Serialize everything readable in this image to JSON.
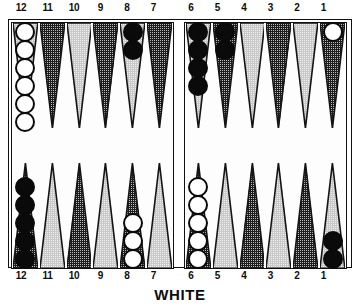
{
  "board": {
    "caption": "WHITE",
    "top_labels": [
      "12",
      "11",
      "10",
      "9",
      "8",
      "7",
      "6",
      "5",
      "4",
      "3",
      "2",
      "1"
    ],
    "bottom_labels": [
      "12",
      "11",
      "10",
      "9",
      "8",
      "7",
      "6",
      "5",
      "4",
      "3",
      "2",
      "1"
    ],
    "colors": {
      "white_checker": "#ffffff",
      "black_checker": "#0a0a0a",
      "outline": "#0a0a0a",
      "point_light": "#efefef",
      "point_dark": "#bdbdbd",
      "board_background": "#ffffff",
      "frame": "#101010"
    },
    "quadrants": {
      "top_left": {
        "name": "top-left-quadrant",
        "points": [
          {
            "label": "12",
            "shade": "light",
            "checkers": 6,
            "color": "white"
          },
          {
            "label": "11",
            "shade": "dark",
            "checkers": 0,
            "color": ""
          },
          {
            "label": "10",
            "shade": "light",
            "checkers": 0,
            "color": ""
          },
          {
            "label": "9",
            "shade": "dark",
            "checkers": 0,
            "color": ""
          },
          {
            "label": "8",
            "shade": "light",
            "checkers": 2,
            "color": "black"
          },
          {
            "label": "7",
            "shade": "dark",
            "checkers": 0,
            "color": ""
          }
        ]
      },
      "top_right": {
        "name": "top-right-quadrant",
        "points": [
          {
            "label": "6",
            "shade": "light",
            "checkers": 4,
            "color": "black"
          },
          {
            "label": "5",
            "shade": "dark",
            "checkers": 2,
            "color": "black"
          },
          {
            "label": "4",
            "shade": "light",
            "checkers": 0,
            "color": ""
          },
          {
            "label": "3",
            "shade": "dark",
            "checkers": 0,
            "color": ""
          },
          {
            "label": "2",
            "shade": "light",
            "checkers": 0,
            "color": ""
          },
          {
            "label": "1",
            "shade": "dark",
            "checkers": 1,
            "color": "white"
          }
        ]
      },
      "bottom_left": {
        "name": "bottom-left-quadrant",
        "points": [
          {
            "label": "12",
            "shade": "dark",
            "checkers": 5,
            "color": "black"
          },
          {
            "label": "11",
            "shade": "light",
            "checkers": 0,
            "color": ""
          },
          {
            "label": "10",
            "shade": "dark",
            "checkers": 0,
            "color": ""
          },
          {
            "label": "9",
            "shade": "light",
            "checkers": 0,
            "color": ""
          },
          {
            "label": "8",
            "shade": "dark",
            "checkers": 3,
            "color": "white"
          },
          {
            "label": "7",
            "shade": "light",
            "checkers": 0,
            "color": ""
          }
        ]
      },
      "bottom_right": {
        "name": "bottom-right-quadrant",
        "points": [
          {
            "label": "6",
            "shade": "dark",
            "checkers": 5,
            "color": "white"
          },
          {
            "label": "5",
            "shade": "light",
            "checkers": 0,
            "color": ""
          },
          {
            "label": "4",
            "shade": "dark",
            "checkers": 0,
            "color": ""
          },
          {
            "label": "3",
            "shade": "light",
            "checkers": 0,
            "color": ""
          },
          {
            "label": "2",
            "shade": "dark",
            "checkers": 0,
            "color": ""
          },
          {
            "label": "1",
            "shade": "light",
            "checkers": 2,
            "color": "black"
          }
        ]
      }
    }
  }
}
